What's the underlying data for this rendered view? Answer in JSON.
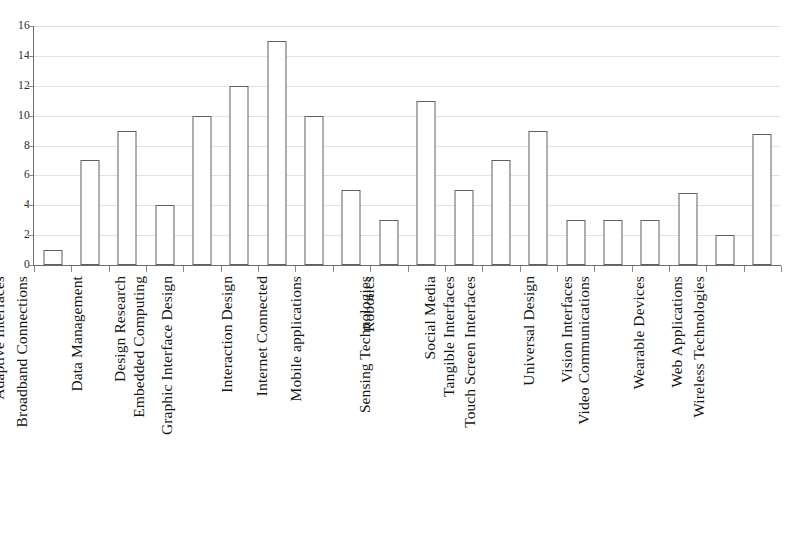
{
  "chart_data": {
    "type": "bar",
    "title": "",
    "subtitle": "",
    "xlabel": "",
    "ylabel": "",
    "ylim": [
      0,
      16
    ],
    "ytick_step": 2,
    "yticks": [
      0,
      2,
      4,
      6,
      8,
      10,
      12,
      14,
      16
    ],
    "grid": true,
    "legend": "none",
    "orientation": "vertical",
    "bar_style": {
      "fill": "#ffffff",
      "stroke": "#5f5f5f"
    },
    "categories": [
      "Adaptive Interfaces",
      "Broadband Connections",
      "Data Management",
      "Design Research",
      "Embedded Computing",
      "Graphic Interface Design",
      "Interaction Design",
      "Internet Connected",
      "Mobile applications",
      "Robotics",
      "Sensing Technologies",
      "Social Media",
      "Tangible Interfaces",
      "Touch Screen Interfaces",
      "Universal Design",
      "Vision Interfaces",
      "Video Communications",
      "Wearable Devices",
      "Web Applications",
      "Wireless Technologies"
    ],
    "values": [
      1,
      7,
      9,
      4,
      10,
      12,
      15,
      10,
      5,
      3,
      11,
      5,
      7,
      9,
      3,
      3,
      3,
      4.8,
      2,
      8.8
    ]
  }
}
